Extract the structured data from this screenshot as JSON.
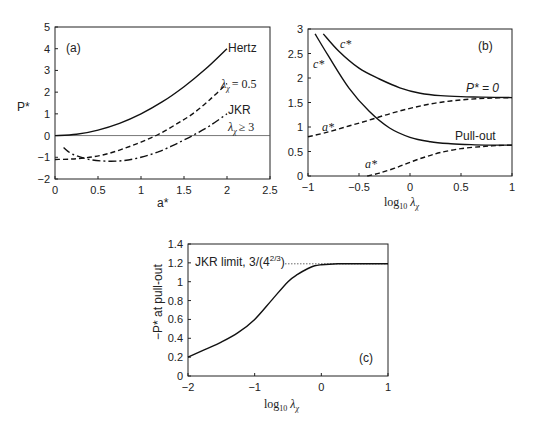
{
  "chart_data": [
    {
      "id": "a",
      "type": "line",
      "panel_label": "(a)",
      "xlabel": "a*",
      "ylabel": "P*",
      "xlim": [
        0,
        2.5
      ],
      "ylim": [
        -2,
        5
      ],
      "xticks": [
        "0",
        "0.5",
        "1",
        "1.5",
        "2",
        "2.5"
      ],
      "yticks": [
        "5",
        "4",
        "3",
        "2",
        "1",
        "0",
        "−1",
        "−2"
      ],
      "zero_line": true,
      "series": [
        {
          "name": "Hertz",
          "style": "solid",
          "x": [
            0,
            0.25,
            0.5,
            0.75,
            1.0,
            1.25,
            1.5,
            1.75,
            2.0
          ],
          "y": [
            0,
            0.06,
            0.25,
            0.56,
            1.0,
            1.56,
            2.25,
            3.06,
            4.0
          ]
        },
        {
          "name": "λ_χ = 0.5",
          "style": "dashed",
          "x": [
            0,
            0.2,
            0.4,
            0.6,
            0.8,
            1.0,
            1.2,
            1.4,
            1.6,
            1.8,
            2.0
          ],
          "y": [
            -1.1,
            -1.08,
            -1.0,
            -0.85,
            -0.6,
            -0.3,
            0.05,
            0.5,
            1.0,
            1.65,
            2.4
          ]
        },
        {
          "name": "JKR λ_χ ≥ 3",
          "style": "dashdot",
          "x": [
            0.1,
            0.2,
            0.4,
            0.6,
            0.8,
            1.0,
            1.2,
            1.4,
            1.6,
            1.8,
            2.0
          ],
          "y": [
            -0.55,
            -0.85,
            -1.1,
            -1.18,
            -1.15,
            -1.0,
            -0.75,
            -0.4,
            0.0,
            0.45,
            1.0
          ]
        }
      ],
      "annotations": [
        "Hertz",
        "λχ = 0.5",
        "JKR",
        "λχ ≥ 3"
      ]
    },
    {
      "id": "b",
      "type": "line",
      "panel_label": "(b)",
      "xlabel": "log10 λχ",
      "ylabel": "",
      "xlim": [
        -1,
        1
      ],
      "ylim": [
        0,
        3
      ],
      "xticks": [
        "−1",
        "−0.5",
        "0",
        "0.5",
        "1"
      ],
      "yticks": [
        "3",
        "2.5",
        "2",
        "1.5",
        "1",
        "0.5",
        "0"
      ],
      "series": [
        {
          "name": "c* (P* = 0)",
          "style": "solid",
          "x": [
            -0.85,
            -0.7,
            -0.5,
            -0.3,
            -0.1,
            0.1,
            0.3,
            0.5,
            0.7,
            1.0
          ],
          "y": [
            2.9,
            2.55,
            2.2,
            1.98,
            1.8,
            1.69,
            1.64,
            1.62,
            1.61,
            1.6
          ]
        },
        {
          "name": "c* (pull-out)",
          "style": "solid",
          "x": [
            -0.93,
            -0.8,
            -0.6,
            -0.4,
            -0.2,
            0.0,
            0.2,
            0.4,
            0.6,
            0.8,
            1.0
          ],
          "y": [
            2.9,
            2.45,
            1.8,
            1.32,
            0.98,
            0.79,
            0.7,
            0.66,
            0.64,
            0.63,
            0.63
          ]
        },
        {
          "name": "a* (P* = 0)",
          "style": "dashed",
          "x": [
            -1.0,
            -0.8,
            -0.6,
            -0.4,
            -0.2,
            0.0,
            0.2,
            0.4,
            0.6,
            0.8,
            1.0
          ],
          "y": [
            0.8,
            0.9,
            1.02,
            1.14,
            1.27,
            1.38,
            1.47,
            1.53,
            1.57,
            1.59,
            1.6
          ]
        },
        {
          "name": "a* (pull-out)",
          "style": "dashed",
          "x": [
            -0.42,
            -0.3,
            -0.15,
            0.0,
            0.15,
            0.3,
            0.5,
            0.7,
            0.85,
            1.0
          ],
          "y": [
            0.0,
            0.06,
            0.16,
            0.28,
            0.39,
            0.48,
            0.56,
            0.6,
            0.62,
            0.63
          ]
        }
      ],
      "annotations": [
        "c*",
        "c*",
        "P* = 0",
        "a*",
        "Pull-out",
        "a*"
      ]
    },
    {
      "id": "c",
      "type": "line",
      "panel_label": "(c)",
      "xlabel": "log10 λχ",
      "ylabel": "−P* at pull-out",
      "xlim": [
        -2,
        1
      ],
      "ylim": [
        0,
        1.4
      ],
      "xticks": [
        "−2",
        "−1",
        "0",
        "1"
      ],
      "yticks": [
        "1.4",
        "1.2",
        "1",
        "0.8",
        "0.6",
        "0.4",
        "0.2",
        "0"
      ],
      "reference_line": {
        "label": "JKR limit, 3/(4^(2/3))",
        "y": 1.19,
        "style": "dotted"
      },
      "series": [
        {
          "name": "−P* at pull-out",
          "style": "solid",
          "x": [
            -2.0,
            -1.75,
            -1.5,
            -1.25,
            -1.0,
            -0.75,
            -0.5,
            -0.35,
            -0.2,
            -0.1,
            0.0,
            0.25,
            0.5,
            1.0
          ],
          "y": [
            0.2,
            0.28,
            0.36,
            0.46,
            0.6,
            0.8,
            1.0,
            1.08,
            1.14,
            1.17,
            1.18,
            1.19,
            1.19,
            1.19
          ]
        }
      ]
    }
  ],
  "labels": {
    "a_panel": "(a)",
    "a_ylabel": "P*",
    "a_xlabel": "a*",
    "a_hertz": "Hertz",
    "a_lambda": "λ",
    "a_chi": "χ",
    "a_eq": "= 0.5",
    "a_jkr": "JKR",
    "a_geq": "≥ 3",
    "b_panel": "(b)",
    "b_cstar": "c*",
    "b_pzero": "P* = 0",
    "b_astar": "a*",
    "b_pullout": "Pull-out",
    "log": "log",
    "ten": "10",
    "c_panel": "(c)",
    "c_ylabel": "−P* at pull-out",
    "c_jkr": "JKR limit, 3/(4",
    "c_exp": "2/3",
    "c_close": ")"
  }
}
